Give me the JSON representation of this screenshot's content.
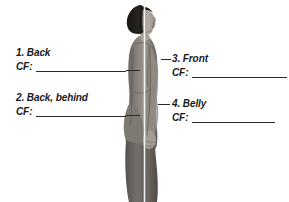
{
  "page": {
    "background_color": "#ffffff",
    "width": 289,
    "height": 202,
    "kind": "anatomy-worksheet-figure"
  },
  "figure": {
    "name": "female-profile-silhouette",
    "center_line_color": "#f2f2f0",
    "skin_tone": "#a9a39c",
    "hair_color": "#1e1c1b",
    "garment_color": "#7d7873",
    "shorts_color": "#6a6560"
  },
  "annotations": [
    {
      "id": "1",
      "number": "1.",
      "title": "Back",
      "full_title": "1. Back",
      "cf_label": "CF:",
      "cf_value": "",
      "side": "left"
    },
    {
      "id": "2",
      "number": "2.",
      "title": "Back, behind",
      "full_title": "2. Back, behind",
      "cf_label": "CF:",
      "cf_value": "",
      "side": "left"
    },
    {
      "id": "3",
      "number": "3.",
      "title": "Front",
      "full_title": "3. Front",
      "cf_label": "CF:",
      "cf_value": "",
      "side": "right"
    },
    {
      "id": "4",
      "number": "4.",
      "title": "Belly",
      "full_title": "4. Belly",
      "cf_label": "CF:",
      "cf_value": "",
      "side": "right"
    }
  ],
  "colors": {
    "text": "#1a1a1a",
    "rule": "#2b2b2b",
    "background": "#ffffff"
  }
}
